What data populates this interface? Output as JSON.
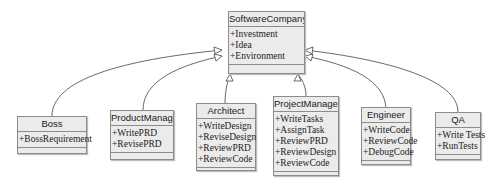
{
  "diagram": {
    "type": "UML class diagram (generalization)",
    "parent": {
      "name": "SoftwareCompany",
      "attributes": [
        "+Investment",
        "+Idea",
        "+Environment"
      ]
    },
    "children": [
      {
        "name": "Boss",
        "attributes": [
          "+BossRequirement"
        ]
      },
      {
        "name": "ProductManager",
        "attributes": [
          "+WritePRD",
          "+RevisePRD"
        ]
      },
      {
        "name": "Architect",
        "attributes": [
          "+WriteDesign",
          "+ReviseDesign",
          "+ReviewPRD",
          "+ReviewCode"
        ]
      },
      {
        "name": "ProjectManager",
        "attributes": [
          "+WriteTasks",
          "+AssignTask",
          "+ReviewPRD",
          "+ReviewDesign",
          "+ReviewCode"
        ]
      },
      {
        "name": "Engineer",
        "attributes": [
          "+WriteCode",
          "+ReviewCode",
          "+DebugCode"
        ]
      },
      {
        "name": "QA",
        "attributes": [
          "+Write Tests",
          "+RunTests"
        ]
      }
    ],
    "relationship": "inheritance",
    "colors": {
      "box_fill": "#ebebeb",
      "box_border": "#8c8c8c",
      "line": "#444444",
      "arrowhead_fill": "#ffffff"
    }
  }
}
